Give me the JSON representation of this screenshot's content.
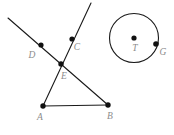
{
  "figure": {
    "width": 174,
    "height": 135,
    "background_color": "#ffffff",
    "stroke_color": "#1a1a1a",
    "point_color": "#111111",
    "label_color": "#8c8c8c",
    "stroke_width": 1.1,
    "point_radius": 2.6
  },
  "points": {
    "A": {
      "label": "A",
      "x": 43,
      "y": 106,
      "label_x": 40,
      "label_y": 120
    },
    "B": {
      "label": "B",
      "x": 108,
      "y": 105,
      "label_x": 110,
      "label_y": 119
    },
    "C": {
      "label": "C",
      "x": 72,
      "y": 39,
      "label_x": 77,
      "label_y": 50
    },
    "D": {
      "label": "D",
      "x": 41,
      "y": 45,
      "label_x": 32,
      "label_y": 58
    },
    "E": {
      "label": "E",
      "x": 61,
      "y": 64,
      "label_x": 64,
      "label_y": 79
    },
    "T": {
      "label": "T",
      "x": 134,
      "y": 38,
      "label_x": 135,
      "label_y": 51
    },
    "G": {
      "label": "G",
      "x": 156,
      "y": 44,
      "label_x": 160,
      "label_y": 55
    }
  },
  "circle": {
    "name": "circle-T",
    "center_x": 134,
    "center_y": 38,
    "radius": 24.5
  },
  "segments": [
    {
      "name": "line-through-D-E-B",
      "x1": 8,
      "y1": 18,
      "x2": 108,
      "y2": 105
    },
    {
      "name": "line-through-C-E-A",
      "x1": 91,
      "y1": 3,
      "x2": 43,
      "y2": 106
    },
    {
      "name": "segment-A-B",
      "x1": 43,
      "y1": 106,
      "x2": 108,
      "y2": 105
    }
  ],
  "labels_order": [
    "D",
    "C",
    "E",
    "A",
    "B",
    "T",
    "G"
  ]
}
